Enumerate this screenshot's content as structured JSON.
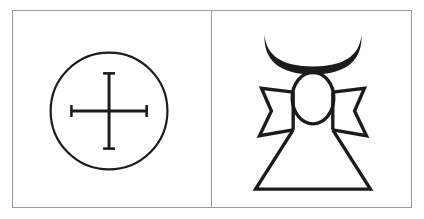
{
  "figure": {
    "background_color": "#ffffff",
    "ink_color": "#1b1b1b",
    "panel_border_color": "#9a9a9a",
    "panel_count": 2
  },
  "panels": [
    {
      "id": "left",
      "name": "sun-cross-panel",
      "symbol_name": "sun-cross",
      "alt_text": "Circle enclosing an equal-armed cross with serif end caps",
      "elements": [
        {
          "name": "circle-outline",
          "shape": "circle"
        },
        {
          "name": "cross-vertical-stroke",
          "shape": "line"
        },
        {
          "name": "cross-horizontal-stroke",
          "shape": "line"
        },
        {
          "name": "cross-serif-caps",
          "shape": "line",
          "count": 4
        }
      ],
      "geometry": {
        "circle_cx": 97,
        "circle_cy": 101,
        "circle_r": 59,
        "cross_half_v": 38,
        "cross_half_h": 38,
        "serif_half": 6,
        "stroke_width_circle": 2.2,
        "stroke_width_cross": 3.0,
        "stroke_width_serif": 2.6
      }
    },
    {
      "id": "right",
      "name": "crescent-ankh-panel",
      "symbol_name": "crescent-ankh",
      "alt_text": "Ankh-like robed figure topped by an upward crescent above an oval loop, with notched cross arms and a flared skirt",
      "elements": [
        {
          "name": "crescent-moon-shape",
          "shape": "crescent"
        },
        {
          "name": "oval-loop-shape",
          "shape": "ellipse"
        },
        {
          "name": "left-arm-shape",
          "shape": "notched-arm"
        },
        {
          "name": "right-arm-shape",
          "shape": "notched-arm"
        },
        {
          "name": "skirt-shape",
          "shape": "trapezoid"
        }
      ],
      "geometry": {
        "stroke_width": 3.4,
        "crescent_cx": 102,
        "crescent_top": 22,
        "crescent_bottom": 60,
        "crescent_half_width": 49,
        "oval_cx": 102,
        "oval_cy": 87,
        "oval_rx": 22,
        "oval_ry": 27,
        "arm_top": 80,
        "arm_outer_x_left": 49,
        "arm_outer_x_right": 155,
        "arm_bottom": 128,
        "skirt_top_half_width": 22,
        "skirt_bottom_half_width": 58,
        "skirt_bottom": 180
      }
    }
  ]
}
